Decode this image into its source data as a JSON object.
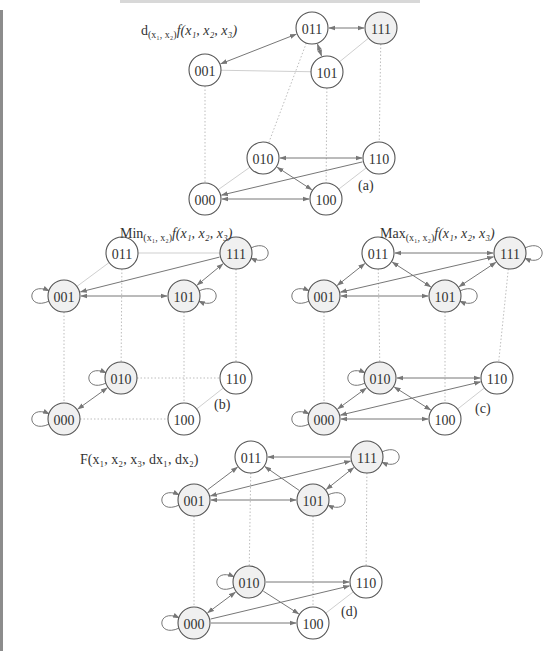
{
  "colors": {
    "node_stroke": "#555555",
    "node_fill_white": "#ffffff",
    "node_fill_gray": "#f0f0f0",
    "arrow": "#777777",
    "dotted": "#bdbdbd",
    "plain": "#cfcfcf"
  },
  "node_radius": 16,
  "diagrams": [
    {
      "id": "a",
      "tag": "(a)",
      "tag_pos": [
        358,
        190
      ],
      "title_parts": [
        {
          "t": "d",
          "sub": false
        },
        {
          "t": "(x₁, x₂)",
          "sub": true
        },
        {
          "t": "f(x₁, x₂, x₃)",
          "sub": false
        }
      ],
      "title_pos": [
        141,
        35
      ],
      "nodes": {
        "011": {
          "x": 312,
          "y": 28,
          "fill": "white"
        },
        "111": {
          "x": 381,
          "y": 28,
          "fill": "gray"
        },
        "001": {
          "x": 205,
          "y": 70,
          "fill": "white"
        },
        "101": {
          "x": 327,
          "y": 72,
          "fill": "white"
        },
        "010": {
          "x": 263,
          "y": 158,
          "fill": "white"
        },
        "110": {
          "x": 379,
          "y": 158,
          "fill": "white"
        },
        "000": {
          "x": 205,
          "y": 199,
          "fill": "white"
        },
        "100": {
          "x": 326,
          "y": 199,
          "fill": "white"
        }
      },
      "plain": [
        [
          "001",
          "101"
        ],
        [
          "101",
          "111"
        ],
        [
          "000",
          "010"
        ],
        [
          "100",
          "110"
        ]
      ],
      "dotted": [
        [
          "001",
          "000"
        ],
        [
          "011",
          "010"
        ],
        [
          "101",
          "100"
        ],
        [
          "111",
          "110"
        ]
      ],
      "arrows": [
        {
          "from": "011",
          "to": "111",
          "both": true
        },
        {
          "from": "011",
          "to": "001",
          "both": true
        },
        {
          "from": "011",
          "to": "101",
          "both": true
        },
        {
          "from": "010",
          "to": "110",
          "both": true
        },
        {
          "from": "110",
          "to": "000",
          "both": false
        },
        {
          "from": "010",
          "to": "100",
          "both": true
        },
        {
          "from": "000",
          "to": "100",
          "both": true
        }
      ],
      "loops": []
    },
    {
      "id": "b",
      "tag": "(b)",
      "tag_pos": [
        214,
        409
      ],
      "title_parts": [
        {
          "t": "Min",
          "sub": false
        },
        {
          "t": "(x₁, x₂)",
          "sub": true
        },
        {
          "t": "f(x₁, x₂, x₃)",
          "sub": false
        }
      ],
      "title_pos": [
        120,
        238
      ],
      "nodes": {
        "011": {
          "x": 122,
          "y": 253,
          "fill": "white"
        },
        "111": {
          "x": 236,
          "y": 253,
          "fill": "gray"
        },
        "001": {
          "x": 64,
          "y": 296,
          "fill": "gray"
        },
        "101": {
          "x": 184,
          "y": 296,
          "fill": "gray"
        },
        "010": {
          "x": 121,
          "y": 378,
          "fill": "gray"
        },
        "110": {
          "x": 236,
          "y": 378,
          "fill": "white"
        },
        "000": {
          "x": 64,
          "y": 419,
          "fill": "gray"
        },
        "100": {
          "x": 184,
          "y": 419,
          "fill": "white"
        }
      },
      "plain": [
        [
          "011",
          "111"
        ],
        [
          "011",
          "001"
        ],
        [
          "100",
          "110"
        ]
      ],
      "dotted": [
        [
          "001",
          "000"
        ],
        [
          "011",
          "010"
        ],
        [
          "101",
          "100"
        ],
        [
          "111",
          "110"
        ],
        [
          "010",
          "110"
        ],
        [
          "000",
          "100"
        ]
      ],
      "arrows": [
        {
          "from": "111",
          "to": "001",
          "both": false
        },
        {
          "from": "001",
          "to": "101",
          "both": true
        },
        {
          "from": "111",
          "to": "101",
          "both": true
        },
        {
          "from": "010",
          "to": "000",
          "both": true
        }
      ],
      "loops": [
        {
          "node": "111",
          "side": "right"
        },
        {
          "node": "101",
          "side": "right"
        },
        {
          "node": "001",
          "side": "left"
        },
        {
          "node": "010",
          "side": "left"
        },
        {
          "node": "000",
          "side": "left"
        }
      ]
    },
    {
      "id": "c",
      "tag": "(c)",
      "tag_pos": [
        475,
        413
      ],
      "title_parts": [
        {
          "t": "Max",
          "sub": false
        },
        {
          "t": "(x₁, x₂)",
          "sub": true
        },
        {
          "t": "f(x₁, x₂, x₃)",
          "sub": false
        }
      ],
      "title_pos": [
        380,
        238
      ],
      "nodes": {
        "011": {
          "x": 378,
          "y": 253,
          "fill": "white"
        },
        "111": {
          "x": 510,
          "y": 253,
          "fill": "gray"
        },
        "001": {
          "x": 324,
          "y": 296,
          "fill": "gray"
        },
        "101": {
          "x": 445,
          "y": 296,
          "fill": "gray"
        },
        "010": {
          "x": 380,
          "y": 378,
          "fill": "gray"
        },
        "110": {
          "x": 497,
          "y": 378,
          "fill": "white"
        },
        "000": {
          "x": 324,
          "y": 419,
          "fill": "gray"
        },
        "100": {
          "x": 445,
          "y": 419,
          "fill": "white"
        }
      },
      "plain": [
        [
          "100",
          "110"
        ]
      ],
      "dotted": [
        [
          "001",
          "000"
        ],
        [
          "011",
          "010"
        ],
        [
          "101",
          "100"
        ],
        [
          "111",
          "110"
        ]
      ],
      "arrows": [
        {
          "from": "011",
          "to": "111",
          "both": true
        },
        {
          "from": "011",
          "to": "001",
          "both": true
        },
        {
          "from": "011",
          "to": "101",
          "both": true
        },
        {
          "from": "111",
          "to": "001",
          "both": true
        },
        {
          "from": "001",
          "to": "101",
          "both": true
        },
        {
          "from": "111",
          "to": "101",
          "both": true
        },
        {
          "from": "010",
          "to": "110",
          "both": true
        },
        {
          "from": "110",
          "to": "000",
          "both": true
        },
        {
          "from": "010",
          "to": "100",
          "both": true
        },
        {
          "from": "010",
          "to": "000",
          "both": true
        },
        {
          "from": "000",
          "to": "100",
          "both": true
        }
      ],
      "loops": [
        {
          "node": "111",
          "side": "right"
        },
        {
          "node": "101",
          "side": "right"
        },
        {
          "node": "001",
          "side": "left"
        },
        {
          "node": "010",
          "side": "left"
        },
        {
          "node": "000",
          "side": "left"
        }
      ]
    },
    {
      "id": "d",
      "tag": "(d)",
      "tag_pos": [
        341,
        616
      ],
      "title_parts": [
        {
          "t": "F(x₁, x₂, x₃, dx₁, dx₂)",
          "sub": false
        }
      ],
      "title_pos": [
        80,
        464
      ],
      "nodes": {
        "011": {
          "x": 251,
          "y": 457,
          "fill": "white"
        },
        "111": {
          "x": 367,
          "y": 457,
          "fill": "gray"
        },
        "001": {
          "x": 194,
          "y": 500,
          "fill": "gray"
        },
        "101": {
          "x": 313,
          "y": 500,
          "fill": "gray"
        },
        "010": {
          "x": 249,
          "y": 582,
          "fill": "gray"
        },
        "110": {
          "x": 366,
          "y": 582,
          "fill": "white"
        },
        "000": {
          "x": 194,
          "y": 623,
          "fill": "gray"
        },
        "100": {
          "x": 313,
          "y": 623,
          "fill": "white"
        }
      },
      "plain": [
        [
          "100",
          "110"
        ]
      ],
      "dotted": [
        [
          "001",
          "000"
        ],
        [
          "011",
          "010"
        ],
        [
          "101",
          "100"
        ],
        [
          "111",
          "110"
        ]
      ],
      "arrows": [
        {
          "from": "111",
          "to": "011",
          "both": false
        },
        {
          "from": "001",
          "to": "011",
          "both": false
        },
        {
          "from": "101",
          "to": "011",
          "both": false
        },
        {
          "from": "111",
          "to": "001",
          "both": true
        },
        {
          "from": "001",
          "to": "101",
          "both": true
        },
        {
          "from": "111",
          "to": "101",
          "both": true
        },
        {
          "from": "010",
          "to": "110",
          "both": false
        },
        {
          "from": "000",
          "to": "110",
          "both": false
        },
        {
          "from": "010",
          "to": "100",
          "both": false
        },
        {
          "from": "010",
          "to": "000",
          "both": true
        },
        {
          "from": "000",
          "to": "100",
          "both": false
        }
      ],
      "loops": [
        {
          "node": "111",
          "side": "right"
        },
        {
          "node": "101",
          "side": "right"
        },
        {
          "node": "001",
          "side": "left"
        },
        {
          "node": "010",
          "side": "left"
        },
        {
          "node": "000",
          "side": "left"
        }
      ]
    }
  ]
}
